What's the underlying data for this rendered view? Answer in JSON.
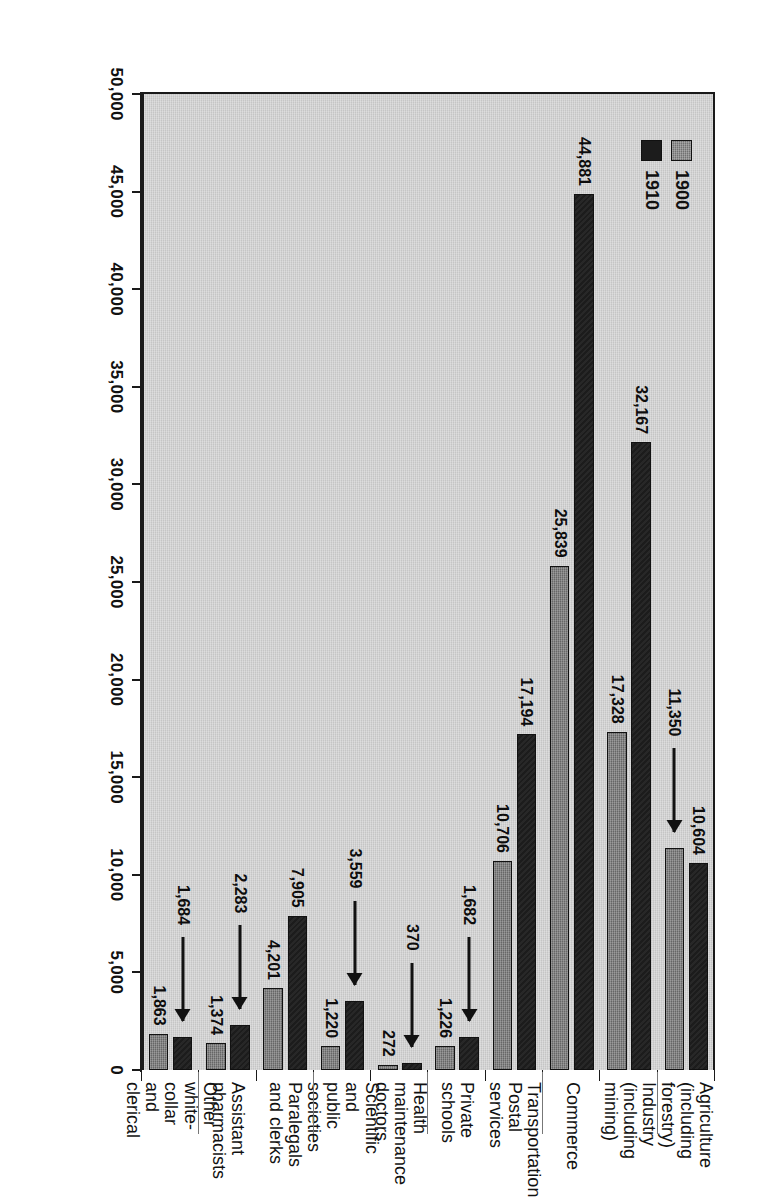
{
  "chart_data": {
    "type": "bar",
    "orientation": "horizontal",
    "title": "",
    "xlabel": "",
    "ylabel": "",
    "grid": false,
    "legend_position": "top-left",
    "axis_ticks": [
      "50,000",
      "45,000",
      "40,000",
      "35,000",
      "30,000",
      "25,000",
      "20,000",
      "15,000",
      "10,000",
      "5,000",
      "0"
    ],
    "axis_tick_values": [
      50000,
      45000,
      40000,
      35000,
      30000,
      25000,
      20000,
      15000,
      10000,
      5000,
      0
    ],
    "xlim": [
      0,
      50000
    ],
    "categories": [
      "Agriculture\n(including\nforestry)",
      "Industry\n(including\nmining)",
      "Commerce",
      "Transportation\nPostal services",
      "Private schools",
      "Health\nmaintenance\ndoctors",
      "Scientific and\npublic societies",
      "Paralegals\nand clerks",
      "Assistant\npharmacists",
      "Other white-collar\nand clerical"
    ],
    "series": [
      {
        "name": "1900",
        "color": "#7d7d7d",
        "values": [
          11350,
          17328,
          25839,
          10706,
          1226,
          272,
          1220,
          4201,
          1374,
          1863
        ],
        "labels": [
          "11,350",
          "17,328",
          "25,839",
          "10,706",
          "1,226",
          "272",
          "1,220",
          "4,201",
          "1,374",
          "1,863"
        ]
      },
      {
        "name": "1910",
        "color": "#1c1c1c",
        "values": [
          10604,
          32167,
          44881,
          17194,
          1682,
          370,
          3559,
          7905,
          2283,
          1684
        ],
        "labels": [
          "10,604",
          "32,167",
          "44,881",
          "17,194",
          "1,682",
          "370",
          "3,559",
          "7,905",
          "2,283",
          "1,684"
        ]
      }
    ],
    "leader_arrows": [
      {
        "series": "1900",
        "category": "Agriculture (including forestry)",
        "label": "11,350"
      },
      {
        "series": "1910",
        "category": "Private schools",
        "label": "1,682"
      },
      {
        "series": "1910",
        "category": "Health maintenance doctors",
        "label": "370"
      },
      {
        "series": "1910",
        "category": "Scientific and public societies",
        "label": "3,559"
      },
      {
        "series": "1910",
        "category": "Assistant pharmacists",
        "label": "2,283"
      },
      {
        "series": "1910",
        "category": "Other white-collar and clerical",
        "label": "1,684"
      }
    ]
  },
  "legend": {
    "items": [
      {
        "label": "1900",
        "swatch": "gray-hatched"
      },
      {
        "label": "1910",
        "swatch": "black-solid"
      }
    ]
  },
  "colors": {
    "plot_background": "#cfcfcf",
    "series_1900": "#7d7d7d",
    "series_1910": "#1c1c1c",
    "axis": "#1a1a1a"
  }
}
